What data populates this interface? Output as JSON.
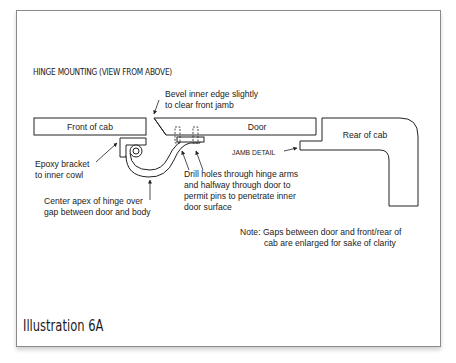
{
  "figure": {
    "heading": "HINGE MOUNTING (VIEW FROM ABOVE)",
    "caption": "Illustration 6A"
  },
  "parts": {
    "front_of_cab": "Front of cab",
    "door": "Door",
    "rear_of_cab": "Rear of cab"
  },
  "annotations": {
    "bevel_line1": "Bevel inner edge slightly",
    "bevel_line2": "to clear front jamb",
    "epoxy_line1": "Epoxy bracket",
    "epoxy_line2": "to inner cowl",
    "center_line1": "Center apex of hinge over",
    "center_line2": "gap between door and body",
    "drill_line1": "Drill holes through hinge arms",
    "drill_line2": "and halfway through door to",
    "drill_line3": "permit pins to penetrate inner",
    "drill_line4": "door surface",
    "jamb_detail": "JAMB DETAIL"
  },
  "note": {
    "line1": "Note: Gaps between door and front/rear of",
    "line2": "cab are enlarged for sake of clarity"
  },
  "colors": {
    "line": "#222222",
    "frame": "#8a8a8a"
  }
}
